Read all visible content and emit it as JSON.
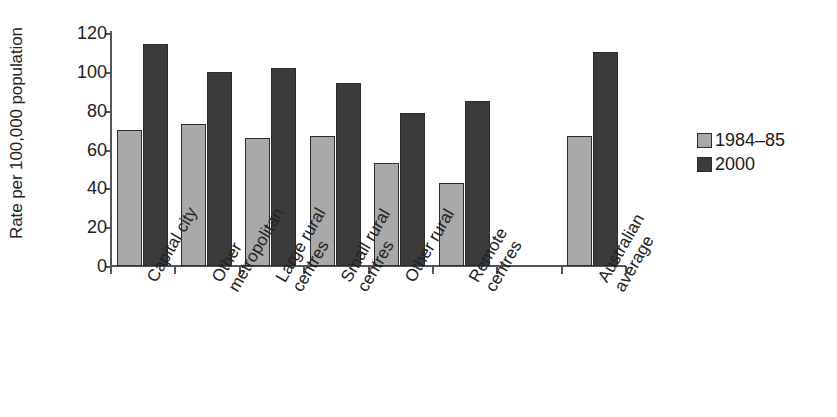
{
  "chart_data": {
    "type": "bar",
    "title": "",
    "subtitle": "",
    "xlabel": "",
    "ylabel": "Rate per 100,000 population",
    "ylim": [
      0,
      120
    ],
    "yticks": [
      0,
      20,
      40,
      60,
      80,
      100,
      120
    ],
    "ytick_labels": [
      "0",
      "20",
      "40",
      "60",
      "80",
      "100",
      "120"
    ],
    "grid": false,
    "legend_position": "right",
    "categories": [
      "Capital city",
      "Other metropolitan",
      "Large rural centres",
      "Small rural centres",
      "Other rural",
      "Remote centres",
      "",
      "Australian average"
    ],
    "category_lines": [
      [
        "Capital city"
      ],
      [
        "Other",
        "metropolitan"
      ],
      [
        "Large rural",
        "centres"
      ],
      [
        "Small rural",
        "centres"
      ],
      [
        "Other rural"
      ],
      [
        "Remote",
        "centres"
      ],
      [
        ""
      ],
      [
        "Australian",
        "average"
      ]
    ],
    "series": [
      {
        "name": "1984–85",
        "color": "#a9a9a9",
        "values": [
          70,
          73,
          66,
          67,
          53,
          43,
          null,
          67
        ]
      },
      {
        "name": "2000",
        "color": "#3b3b3b",
        "values": [
          114.5,
          100,
          102,
          94,
          79,
          85,
          null,
          110
        ]
      }
    ]
  },
  "legend": {
    "items": [
      {
        "label": "1984–85",
        "color": "#a9a9a9"
      },
      {
        "label": "2000",
        "color": "#3b3b3b"
      }
    ]
  },
  "axis": {
    "y_title": "Rate per 100,000 population"
  }
}
